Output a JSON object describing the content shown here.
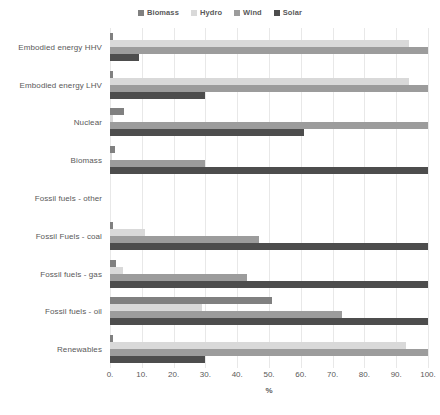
{
  "legend": {
    "position": "top-center",
    "entries": [
      {
        "label": "Biomass",
        "color": "#808080"
      },
      {
        "label": "Hydro",
        "color": "#d9d9d9"
      },
      {
        "label": "Wind",
        "color": "#9c9c9c"
      },
      {
        "label": "Solar",
        "color": "#4d4d4d"
      }
    ]
  },
  "axis": {
    "x_title": "%",
    "ticks": [
      "0.",
      "10.",
      "20.",
      "30.",
      "40.",
      "50.",
      "60.",
      "70.",
      "80.",
      "90.",
      "100."
    ]
  },
  "chart_data": {
    "type": "bar",
    "orientation": "horizontal",
    "title": "",
    "subtitle": "",
    "xlabel": "%",
    "ylabel": "",
    "xlim": [
      0,
      100
    ],
    "grid": true,
    "legend_position": "top-center",
    "categories": [
      "Embodied energy HHV",
      "Embodied energy LHV",
      "Nuclear",
      "Biomass",
      "Fossil fuels  - other",
      "Fossil Fuels - coal",
      "Fossil fuels  - gas",
      "Fossil fuels - oil",
      "Renewables"
    ],
    "series": [
      {
        "name": "Biomass",
        "color": "#808080",
        "values": [
          1.0,
          1.0,
          4.5,
          1.5,
          0,
          1.0,
          2.0,
          51.0,
          1.0
        ]
      },
      {
        "name": "Hydro",
        "color": "#d9d9d9",
        "values": [
          94.0,
          94.0,
          1.0,
          0.5,
          0,
          11.0,
          4.0,
          29.0,
          93.0
        ]
      },
      {
        "name": "Wind",
        "color": "#9c9c9c",
        "values": [
          100.0,
          100.0,
          100.0,
          30.0,
          0,
          47.0,
          43.0,
          73.0,
          100.0
        ]
      },
      {
        "name": "Solar",
        "color": "#4d4d4d",
        "values": [
          9.0,
          30.0,
          61.0,
          100.0,
          0,
          100.0,
          100.0,
          100.0,
          30.0
        ]
      }
    ]
  }
}
